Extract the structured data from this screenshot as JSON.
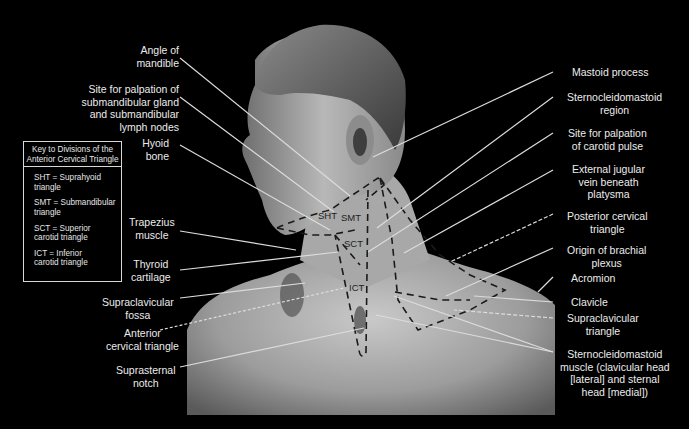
{
  "figure": {
    "key": {
      "title": "Key to Divisions of the\nAnterior Cervical Triangle",
      "items": [
        "SHT = Suprahyoid\ntriangle",
        "SMT = Submandibular\ntriangle",
        "SCT = Superior\ncarotid triangle",
        "ICT = Inferior\ncarotid triangle"
      ]
    },
    "regions": [
      "SHT",
      "SMT",
      "SCT",
      "ICT"
    ],
    "left_labels": [
      "Angle of\nmandible",
      "Site for palpation of\nsubmandibular gland\nand submandibular\nlymph nodes",
      "Hyoid\nbone",
      "Trapezius\nmuscle",
      "Thyroid\ncartilage",
      "Supraclavicular\nfossa",
      "Anterior\ncervical triangle",
      "Suprasternal\nnotch"
    ],
    "right_labels": [
      "Mastoid process",
      "Sternocleidomastoid\nregion",
      "Site for palpation\nof carotid pulse",
      "External jugular\nvein beneath\nplatysma",
      "Posterior cervical\ntriangle",
      "Origin of brachial\nplexus",
      "Acromion",
      "Clavicle",
      "Supraclavicular\ntriangle",
      "Sternocleidomastoid\nmuscle (clavicular head\n[lateral] and sternal\nhead [medial])"
    ],
    "colors": {
      "background": "#000000",
      "leader_line": "#d9d9d9",
      "dashed_boundary": "#1a1a1a",
      "label_text": "#ececec"
    }
  }
}
